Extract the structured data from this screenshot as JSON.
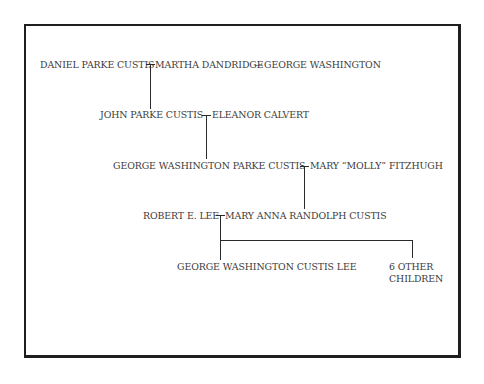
{
  "diagram": {
    "type": "family-tree",
    "generations": [
      {
        "left": "DANIEL PARKE CUSTIS",
        "spouse": "MARTHA DANDRIDGE",
        "second_spouse": "GEORGE WASHINGTON",
        "dash": "—"
      },
      {
        "left": "JOHN PARKE CUSTIS",
        "spouse": "ELEANOR CALVERT"
      },
      {
        "left": "GEORGE WASHINGTON PARKE CUSTIS",
        "spouse": "MARY “MOLLY” FITZHUGH"
      },
      {
        "left": "ROBERT E. LEE",
        "spouse": "MARY ANNA RANDOLPH CUSTIS"
      }
    ],
    "children": [
      {
        "name": "GEORGE WASHINGTON CUSTIS LEE"
      },
      {
        "name_line1": "6 OTHER",
        "name_line2": "CHILDREN"
      }
    ]
  }
}
